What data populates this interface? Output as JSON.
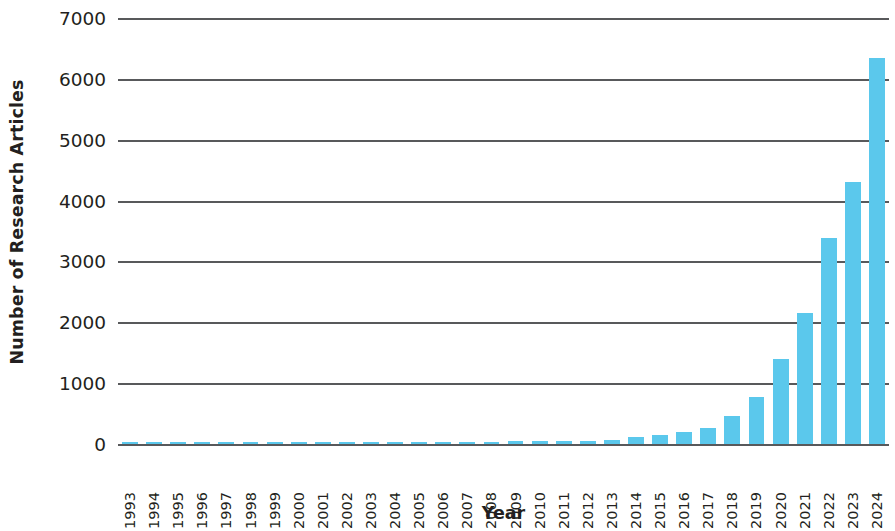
{
  "chart_data": {
    "type": "bar",
    "title": "",
    "xlabel": "Year",
    "ylabel": "Number of Research Articles",
    "categories": [
      "1993",
      "1994",
      "1995",
      "1996",
      "1997",
      "1998",
      "1999",
      "2000",
      "2001",
      "2002",
      "2003",
      "2004",
      "2005",
      "2006",
      "2007",
      "2008",
      "2009",
      "2010",
      "2011",
      "2012",
      "2013",
      "2014",
      "2015",
      "2016",
      "2017",
      "2018",
      "2019",
      "2020",
      "2021",
      "2022",
      "2023",
      "2024"
    ],
    "values": [
      12,
      18,
      20,
      22,
      28,
      26,
      24,
      30,
      28,
      22,
      20,
      24,
      30,
      38,
      28,
      34,
      44,
      48,
      52,
      56,
      70,
      110,
      150,
      200,
      255,
      455,
      780,
      1400,
      2160,
      3380,
      4300,
      6350
    ],
    "ylim": [
      0,
      7000
    ],
    "ytick_labels": [
      "7000",
      "6000",
      "5000",
      "4000",
      "3000",
      "2000",
      "1000",
      "0"
    ],
    "ytick_values": [
      7000,
      6000,
      5000,
      4000,
      3000,
      2000,
      1000,
      0
    ],
    "grid": true,
    "legend": false,
    "bar_color": "#5bc8ec",
    "axis_color": "#58595b",
    "text_color": "#231f20"
  }
}
